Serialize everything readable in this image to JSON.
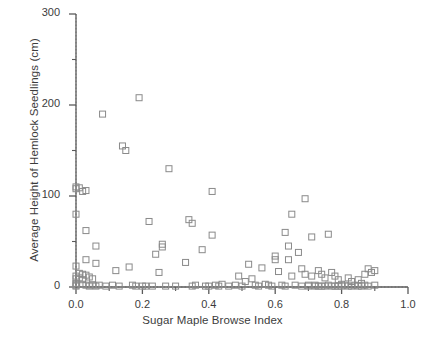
{
  "chart_data": {
    "type": "scatter",
    "title": "",
    "xlabel": "Sugar Maple Browse Index",
    "ylabel": "Average Height of Hemlock Seedlings (cm)",
    "xlim": [
      0.0,
      1.0
    ],
    "ylim": [
      0,
      300
    ],
    "xticks": [
      0.0,
      0.2,
      0.4,
      0.6,
      0.8,
      1.0
    ],
    "xtick_labels": [
      "0.0",
      "0.2",
      "0.4",
      "0.6",
      "0.8",
      "1.0"
    ],
    "xminor_ticks": [
      0.1,
      0.3,
      0.5,
      0.7,
      0.9
    ],
    "yticks": [
      0,
      100,
      200,
      300
    ],
    "ytick_labels": [
      "0",
      "100",
      "200",
      "300"
    ],
    "yminor_ticks": [
      50,
      150,
      250
    ],
    "grid": false,
    "legend": null,
    "marker": "open-square",
    "marker_color": "#8a8a8a",
    "marker_size": 6,
    "reference_lines": [
      {
        "orientation": "vertical",
        "value": 0.0,
        "style": "dotted",
        "color": "#999999"
      },
      {
        "orientation": "horizontal",
        "value": 0.0,
        "style": "dotted",
        "color": "#999999"
      }
    ],
    "series": [
      {
        "name": "Hemlock seedling height vs sugar maple browse index",
        "points": [
          [
            0.0,
            110
          ],
          [
            0.0,
            108
          ],
          [
            0.01,
            109
          ],
          [
            0.02,
            105
          ],
          [
            0.03,
            106
          ],
          [
            0.0,
            80
          ],
          [
            0.0,
            23
          ],
          [
            0.0,
            12
          ],
          [
            0.0,
            9
          ],
          [
            0.0,
            4
          ],
          [
            0.0,
            2
          ],
          [
            0.0,
            1
          ],
          [
            0.01,
            15
          ],
          [
            0.01,
            10
          ],
          [
            0.02,
            14
          ],
          [
            0.02,
            8
          ],
          [
            0.02,
            3
          ],
          [
            0.03,
            62
          ],
          [
            0.03,
            30
          ],
          [
            0.03,
            13
          ],
          [
            0.03,
            2
          ],
          [
            0.04,
            11
          ],
          [
            0.04,
            1
          ],
          [
            0.05,
            9
          ],
          [
            0.05,
            2
          ],
          [
            0.06,
            45
          ],
          [
            0.06,
            26
          ],
          [
            0.06,
            1
          ],
          [
            0.07,
            2
          ],
          [
            0.08,
            190
          ],
          [
            0.09,
            1
          ],
          [
            0.11,
            2
          ],
          [
            0.12,
            18
          ],
          [
            0.13,
            1
          ],
          [
            0.14,
            155
          ],
          [
            0.15,
            150
          ],
          [
            0.16,
            22
          ],
          [
            0.17,
            2
          ],
          [
            0.18,
            1
          ],
          [
            0.19,
            208
          ],
          [
            0.2,
            1
          ],
          [
            0.21,
            1
          ],
          [
            0.22,
            72
          ],
          [
            0.23,
            1
          ],
          [
            0.24,
            36
          ],
          [
            0.25,
            16
          ],
          [
            0.26,
            47
          ],
          [
            0.26,
            44
          ],
          [
            0.27,
            1
          ],
          [
            0.28,
            130
          ],
          [
            0.3,
            1
          ],
          [
            0.33,
            27
          ],
          [
            0.34,
            74
          ],
          [
            0.35,
            70
          ],
          [
            0.35,
            1
          ],
          [
            0.36,
            2
          ],
          [
            0.38,
            41
          ],
          [
            0.39,
            1
          ],
          [
            0.4,
            1
          ],
          [
            0.41,
            105
          ],
          [
            0.41,
            57
          ],
          [
            0.42,
            2
          ],
          [
            0.43,
            1
          ],
          [
            0.44,
            3
          ],
          [
            0.46,
            1
          ],
          [
            0.48,
            2
          ],
          [
            0.49,
            12
          ],
          [
            0.5,
            1
          ],
          [
            0.51,
            6
          ],
          [
            0.52,
            25
          ],
          [
            0.53,
            9
          ],
          [
            0.54,
            2
          ],
          [
            0.55,
            1
          ],
          [
            0.56,
            21
          ],
          [
            0.57,
            3
          ],
          [
            0.58,
            2
          ],
          [
            0.59,
            1
          ],
          [
            0.6,
            34
          ],
          [
            0.6,
            30
          ],
          [
            0.61,
            17
          ],
          [
            0.62,
            2
          ],
          [
            0.63,
            60
          ],
          [
            0.63,
            1
          ],
          [
            0.64,
            45
          ],
          [
            0.64,
            30
          ],
          [
            0.65,
            80
          ],
          [
            0.65,
            12
          ],
          [
            0.66,
            2
          ],
          [
            0.67,
            38
          ],
          [
            0.68,
            20
          ],
          [
            0.68,
            1
          ],
          [
            0.69,
            97
          ],
          [
            0.69,
            14
          ],
          [
            0.7,
            2
          ],
          [
            0.7,
            1
          ],
          [
            0.71,
            55
          ],
          [
            0.71,
            12
          ],
          [
            0.72,
            2
          ],
          [
            0.72,
            1
          ],
          [
            0.73,
            18
          ],
          [
            0.73,
            1
          ],
          [
            0.74,
            14
          ],
          [
            0.74,
            1
          ],
          [
            0.75,
            10
          ],
          [
            0.75,
            1
          ],
          [
            0.76,
            58
          ],
          [
            0.76,
            2
          ],
          [
            0.77,
            16
          ],
          [
            0.77,
            1
          ],
          [
            0.78,
            12
          ],
          [
            0.78,
            1
          ],
          [
            0.79,
            8
          ],
          [
            0.79,
            1
          ],
          [
            0.8,
            3
          ],
          [
            0.8,
            1
          ],
          [
            0.81,
            2
          ],
          [
            0.82,
            10
          ],
          [
            0.82,
            1
          ],
          [
            0.83,
            6
          ],
          [
            0.83,
            1
          ],
          [
            0.84,
            2
          ],
          [
            0.85,
            1
          ],
          [
            0.85,
            8
          ],
          [
            0.86,
            1
          ],
          [
            0.86,
            4
          ],
          [
            0.87,
            14
          ],
          [
            0.87,
            2
          ],
          [
            0.88,
            20
          ],
          [
            0.88,
            1
          ],
          [
            0.89,
            16
          ],
          [
            0.9,
            18
          ],
          [
            0.9,
            2
          ]
        ]
      }
    ]
  },
  "axes": {
    "plot_left_px": 76,
    "plot_right_px": 408,
    "plot_top_px": 14,
    "plot_bottom_px": 287
  }
}
